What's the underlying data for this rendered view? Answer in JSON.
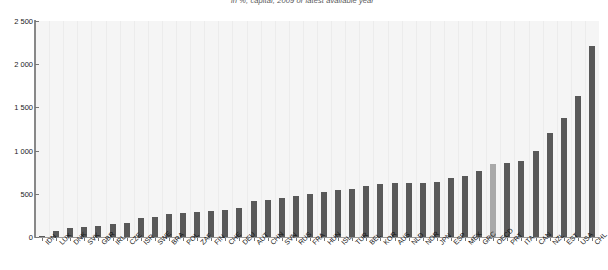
{
  "title": "in %, capital, 2009 or latest available year",
  "chart_data": {
    "type": "bar",
    "title": "in %, capital, 2009 or latest available year",
    "xlabel": "",
    "ylabel": "",
    "ylim": [
      0,
      2500
    ],
    "yticks": [
      0,
      500,
      1000,
      1500,
      2000,
      2500
    ],
    "ytick_labels": [
      "0",
      "500",
      "1 000",
      "1 500",
      "2 000",
      "2 500"
    ],
    "grid": "vertical",
    "legend": "none",
    "highlight_category": "OECD",
    "colors": {
      "bar": "#595959",
      "bar_highlight": "#a9a9a9",
      "plot_background": "#f5f5f5",
      "gridline": "#ececec",
      "axis": "#888888"
    },
    "categories": [
      "IDN",
      "LUX",
      "DNK",
      "SVK",
      "GBR",
      "IRL",
      "CZE",
      "ISR",
      "SWE",
      "BRA",
      "POL",
      "ZAF",
      "FIN",
      "CHE",
      "DEU",
      "AUT",
      "CHN",
      "SVN",
      "RUS",
      "FRA",
      "HUN",
      "ISL",
      "TUR",
      "BEL",
      "KOR",
      "AUS",
      "NLD",
      "NOR",
      "JPN",
      "ESP",
      "MEX",
      "GRC",
      "OECD",
      "PRT",
      "ITA",
      "CAN",
      "NZL",
      "EST",
      "USA",
      "CHL"
    ],
    "values": [
      15,
      70,
      100,
      115,
      130,
      150,
      165,
      215,
      230,
      270,
      280,
      290,
      300,
      310,
      340,
      420,
      430,
      455,
      470,
      500,
      520,
      545,
      560,
      590,
      615,
      620,
      625,
      630,
      640,
      680,
      705,
      760,
      840,
      855,
      880,
      1000,
      1200,
      1380,
      1630,
      2210
    ]
  }
}
